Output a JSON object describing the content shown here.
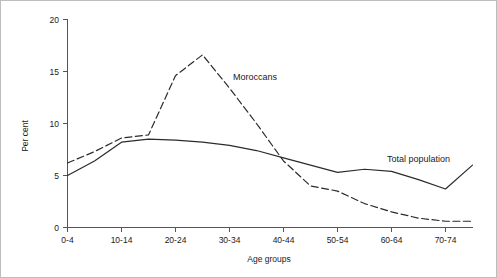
{
  "chart_data": {
    "type": "line",
    "title": "",
    "xlabel": "Age groups",
    "ylabel": "Per cent",
    "ylim": [
      0,
      20
    ],
    "yticks": [
      0,
      5,
      10,
      15,
      20
    ],
    "ytick_labels": [
      "0",
      "5",
      "10",
      "15",
      "20"
    ],
    "grid": false,
    "legend_position": "inline-annotation",
    "categories": [
      "0-4",
      "5-9",
      "10-14",
      "15-19",
      "20-24",
      "25-29",
      "30-34",
      "35-39",
      "40-44",
      "45-49",
      "50-54",
      "55-59",
      "60-64",
      "65-69",
      "70-74",
      "75+"
    ],
    "xtick_labels": [
      "0-4",
      "10-14",
      "20-24",
      "30-34",
      "40-44",
      "50-54",
      "60-64",
      "70-74"
    ],
    "xtick_categories": [
      "0-4",
      "10-14",
      "20-24",
      "30-34",
      "40-44",
      "50-54",
      "60-64",
      "70-74"
    ],
    "series": [
      {
        "name": "Moroccans",
        "style": "dashed",
        "color": "#2b2b2b",
        "label_text": "Moroccans",
        "values": [
          6.2,
          7.3,
          8.6,
          8.9,
          14.6,
          16.6,
          13.4,
          10.0,
          6.4,
          4.0,
          3.5,
          2.3,
          1.5,
          0.9,
          0.6,
          0.6
        ]
      },
      {
        "name": "Total population",
        "style": "solid",
        "color": "#2b2b2b",
        "label_text": "Total population",
        "values": [
          5.0,
          6.4,
          8.2,
          8.5,
          8.4,
          8.2,
          7.9,
          7.4,
          6.7,
          6.0,
          5.3,
          5.6,
          5.4,
          4.6,
          3.7,
          6.0
        ]
      }
    ],
    "annotations": [
      {
        "text": "Moroccans",
        "series": "Moroccans"
      },
      {
        "text": "Total population",
        "series": "Total population"
      }
    ]
  }
}
